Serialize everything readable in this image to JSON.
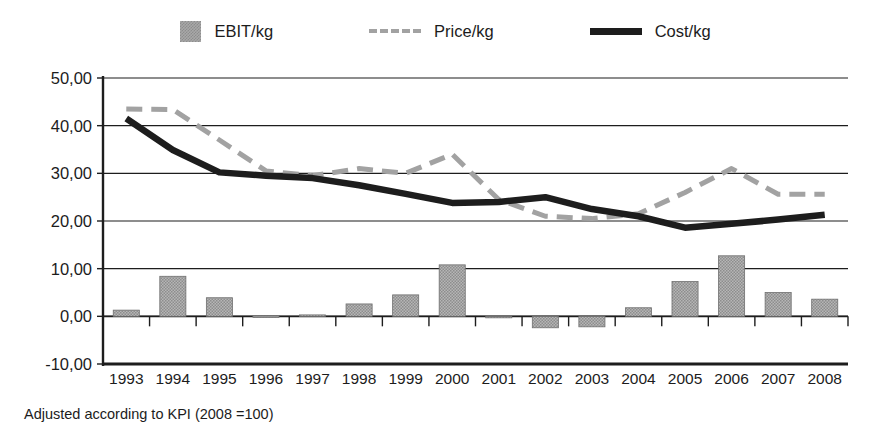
{
  "legend": {
    "items": [
      {
        "label": "EBIT/kg",
        "icon": "bar-swatch-icon",
        "color": "#a8a8a8",
        "style": "bar"
      },
      {
        "label": "Price/kg",
        "icon": "dashed-line-swatch-icon",
        "color": "#a2a2a2",
        "style": "dashed"
      },
      {
        "label": "Cost/kg",
        "icon": "solid-line-swatch-icon",
        "color": "#1d1d1d",
        "style": "solid"
      }
    ]
  },
  "footnote": "Adjusted according to KPI (2008 =100)",
  "axis": {
    "y_tick_labels": [
      "50,00",
      "40,00",
      "30,00",
      "20,00",
      "10,00",
      "0,00",
      "-10,00"
    ],
    "x_tick_labels": [
      "1993",
      "1994",
      "1995",
      "1996",
      "1997",
      "1998",
      "1999",
      "2000",
      "2001",
      "2002",
      "2003",
      "2004",
      "2005",
      "2006",
      "2007",
      "2008"
    ]
  },
  "chart_data": {
    "type": "bar",
    "title": "",
    "subtitle": "",
    "xlabel": "",
    "ylabel": "",
    "ylim": [
      -10,
      50
    ],
    "ytick_step": 10,
    "grid": true,
    "legend_position": "top-center",
    "decimal_separator": ",",
    "categories": [
      "1993",
      "1994",
      "1995",
      "1996",
      "1997",
      "1998",
      "1999",
      "2000",
      "2001",
      "2002",
      "2003",
      "2004",
      "2005",
      "2006",
      "2007",
      "2008"
    ],
    "series": [
      {
        "name": "EBIT/kg",
        "type": "bar",
        "color": "#a8a8a8",
        "values": [
          1.3,
          8.4,
          3.9,
          0.1,
          0.3,
          2.6,
          4.5,
          10.8,
          0.0,
          -2.4,
          -2.2,
          1.8,
          7.3,
          12.7,
          5.0,
          3.6
        ]
      },
      {
        "name": "Price/kg",
        "type": "line",
        "style": "dashed",
        "color": "#a2a2a2",
        "values": [
          43.5,
          43.4,
          37.0,
          30.5,
          29.5,
          31.0,
          30.0,
          34.0,
          24.5,
          21.0,
          20.5,
          21.5,
          26.0,
          31.0,
          25.6,
          25.6
        ]
      },
      {
        "name": "Cost/kg",
        "type": "line",
        "style": "solid",
        "color": "#1d1d1d",
        "values": [
          41.5,
          34.9,
          30.2,
          29.5,
          29.0,
          27.5,
          25.7,
          23.8,
          24.0,
          25.0,
          22.5,
          21.0,
          18.6,
          19.4,
          20.3,
          21.3
        ]
      }
    ]
  }
}
